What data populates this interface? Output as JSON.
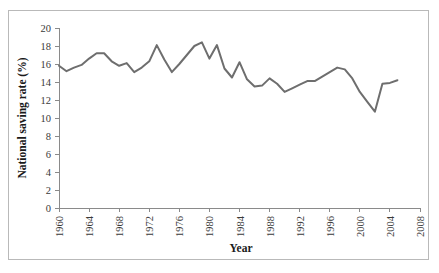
{
  "chart_data": {
    "type": "line",
    "title": "",
    "xlabel": "Year",
    "ylabel": "National saving rate (%)",
    "xlim": [
      1960,
      2008
    ],
    "ylim": [
      0,
      20
    ],
    "grid": false,
    "legend": null,
    "x_ticks": [
      "1960",
      "1964",
      "1968",
      "1972",
      "1976",
      "1980",
      "1984",
      "1988",
      "1992",
      "1996",
      "2000",
      "2004",
      "2008"
    ],
    "y_ticks": [
      "0",
      "2",
      "4",
      "6",
      "8",
      "10",
      "12",
      "14",
      "16",
      "18",
      "20"
    ],
    "line_color": "#6e6e6e",
    "x": [
      1960,
      1961,
      1962,
      1963,
      1964,
      1965,
      1966,
      1967,
      1968,
      1969,
      1970,
      1971,
      1972,
      1973,
      1974,
      1975,
      1976,
      1977,
      1978,
      1979,
      1980,
      1981,
      1982,
      1983,
      1984,
      1985,
      1986,
      1987,
      1988,
      1989,
      1990,
      1991,
      1992,
      1993,
      1994,
      1995,
      1996,
      1997,
      1998,
      1999,
      2000,
      2001,
      2002,
      2003,
      2004,
      2005
    ],
    "series": [
      {
        "name": "National saving rate",
        "values": [
          15.8,
          15.2,
          15.6,
          15.9,
          16.6,
          17.2,
          17.2,
          16.3,
          15.8,
          16.1,
          15.1,
          15.6,
          16.3,
          18.1,
          16.5,
          15.1,
          16.0,
          17.0,
          18.0,
          18.4,
          16.6,
          18.1,
          15.5,
          14.5,
          16.2,
          14.3,
          13.5,
          13.6,
          14.4,
          13.8,
          12.9,
          13.3,
          13.7,
          14.1,
          14.1,
          14.6,
          15.1,
          15.6,
          15.4,
          14.4,
          12.9,
          11.8,
          10.7,
          13.8,
          13.9,
          14.2
        ]
      }
    ]
  }
}
